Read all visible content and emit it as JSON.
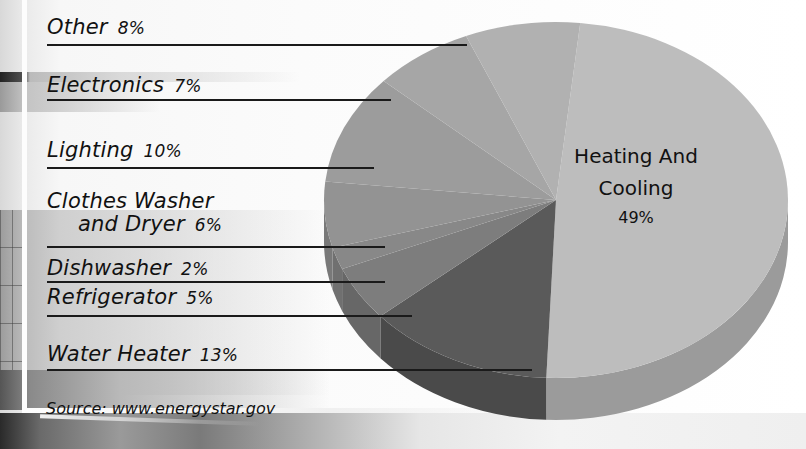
{
  "chart_data": {
    "type": "pie",
    "title": "",
    "style": "3d-pie",
    "slices": [
      {
        "label": "Heating And Cooling",
        "value": 49,
        "display": "49%",
        "color": "#bdbdbd"
      },
      {
        "label": "Water Heater",
        "value": 13,
        "display": "13%",
        "color": "#5a5a5a"
      },
      {
        "label": "Refrigerator",
        "value": 5,
        "display": "5%",
        "color": "#7d7d7d"
      },
      {
        "label": "Dishwasher",
        "value": 2,
        "display": "2%",
        "color": "#888888"
      },
      {
        "label": "Clothes Washer and Dryer",
        "value": 6,
        "display": "6%",
        "color": "#939393"
      },
      {
        "label": "Lighting",
        "value": 10,
        "display": "10%",
        "color": "#9c9c9c"
      },
      {
        "label": "Electronics",
        "value": 7,
        "display": "7%",
        "color": "#a6a6a6"
      },
      {
        "label": "Other",
        "value": 8,
        "display": "8%",
        "color": "#b1b1b1"
      }
    ],
    "legend_position": "left",
    "source": "Source: www.energystar.gov"
  },
  "legend": [
    {
      "name": "Other",
      "pct": "8%"
    },
    {
      "name": "Electronics",
      "pct": "7%"
    },
    {
      "name": "Lighting",
      "pct": "10%"
    },
    {
      "name_line1": "Clothes Washer",
      "name_line2": "and Dryer",
      "pct": "6%"
    },
    {
      "name": "Dishwasher",
      "pct": "2%"
    },
    {
      "name": "Refrigerator",
      "pct": "5%"
    },
    {
      "name": "Water Heater",
      "pct": "13%"
    }
  ],
  "center_label": {
    "line1": "Heating And",
    "line2": "Cooling",
    "value": "49%"
  },
  "source": "Source: www.energystar.gov"
}
